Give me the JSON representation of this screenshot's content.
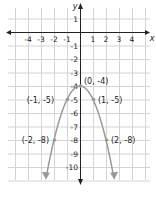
{
  "chart_data": {
    "type": "line",
    "title": "",
    "xlabel": "x",
    "ylabel": "y",
    "xlim": [
      -4,
      4
    ],
    "ylim": [
      -10,
      1
    ],
    "grid": true,
    "x_ticks": [
      "-4",
      "-3",
      "-2",
      "-1",
      "1",
      "2",
      "3",
      "4"
    ],
    "y_ticks": [
      "1",
      "-1",
      "-2",
      "-3",
      "-4",
      "-5",
      "-6",
      "-7",
      "-8",
      "-9",
      "-10"
    ],
    "function": "y = -x^2 - 4",
    "series": [
      {
        "name": "parabola",
        "x": [
          -2,
          -1,
          0,
          1,
          2
        ],
        "y": [
          -8,
          -5,
          -4,
          -5,
          -8
        ]
      }
    ],
    "annotations": [
      {
        "label": "(0, -4)",
        "x": 0,
        "y": -4
      },
      {
        "label": "(-1, -5)",
        "x": -1,
        "y": -5
      },
      {
        "label": "(1, -5)",
        "x": 1,
        "y": -5
      },
      {
        "label": "(-2, -8)",
        "x": -2,
        "y": -8
      },
      {
        "label": "(2, -8)",
        "x": 2,
        "y": -8
      }
    ],
    "colors": {
      "curve": "#9a9a9a",
      "grid": "#d4d4d4",
      "axis": "#222222"
    }
  }
}
